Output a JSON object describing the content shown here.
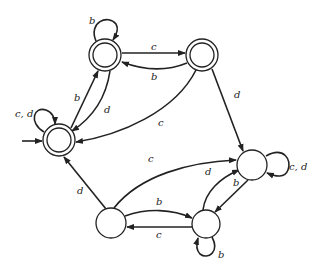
{
  "diagram": {
    "type": "finite-automaton",
    "states": [
      {
        "id": "A",
        "cx": 105,
        "cy": 55,
        "r": 16,
        "accepting": true,
        "start": false
      },
      {
        "id": "B",
        "cx": 202,
        "cy": 55,
        "r": 16,
        "accepting": true,
        "start": false
      },
      {
        "id": "C",
        "cx": 59,
        "cy": 140,
        "r": 16,
        "accepting": true,
        "start": true
      },
      {
        "id": "D",
        "cx": 252,
        "cy": 165,
        "r": 15,
        "accepting": false,
        "start": false
      },
      {
        "id": "E",
        "cx": 111,
        "cy": 223,
        "r": 15,
        "accepting": false,
        "start": false
      },
      {
        "id": "F",
        "cx": 206,
        "cy": 224,
        "r": 14,
        "accepting": false,
        "start": false
      }
    ],
    "transitions": [
      {
        "from": "A",
        "to": "A",
        "label": "b"
      },
      {
        "from": "A",
        "to": "B",
        "label": "c"
      },
      {
        "from": "B",
        "to": "A",
        "label": "b"
      },
      {
        "from": "C",
        "to": "A",
        "label": "b"
      },
      {
        "from": "A",
        "to": "C",
        "label": "d"
      },
      {
        "from": "C",
        "to": "C",
        "label": "c, d"
      },
      {
        "from": "B",
        "to": "C",
        "label": "c"
      },
      {
        "from": "B",
        "to": "D",
        "label": "d"
      },
      {
        "from": "D",
        "to": "D",
        "label": "c, d"
      },
      {
        "from": "E",
        "to": "C",
        "label": "d"
      },
      {
        "from": "E",
        "to": "D",
        "label": "c"
      },
      {
        "from": "E",
        "to": "F",
        "label": "b"
      },
      {
        "from": "F",
        "to": "E",
        "label": "c"
      },
      {
        "from": "F",
        "to": "D",
        "label": "d"
      },
      {
        "from": "D",
        "to": "F",
        "label": "b"
      },
      {
        "from": "F",
        "to": "F",
        "label": "b"
      }
    ],
    "labels": {
      "A_self": "b",
      "A_to_B": "c",
      "B_to_A": "b",
      "C_to_A": "b",
      "A_to_C": "d",
      "C_self": "c, d",
      "B_to_C": "c",
      "B_to_D": "d",
      "D_self": "c, d",
      "E_to_C": "d",
      "E_to_D": "c",
      "E_to_F": "b",
      "F_to_E": "c",
      "F_to_D": "d",
      "D_to_F": "b",
      "F_self": "b"
    }
  }
}
